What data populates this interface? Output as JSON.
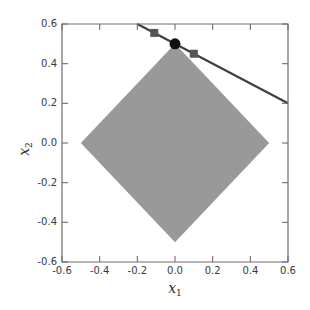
{
  "chart_data": {
    "type": "line",
    "title": "",
    "xlabel": "x_1",
    "ylabel": "x_2",
    "xlim": [
      -0.6,
      0.6
    ],
    "ylim": [
      -0.6,
      0.6
    ],
    "xticks": [
      -0.6,
      -0.4,
      -0.2,
      0.0,
      0.2,
      0.4,
      0.6
    ],
    "yticks": [
      -0.6,
      -0.4,
      -0.2,
      0.0,
      0.2,
      0.4,
      0.6
    ],
    "xtick_labels": [
      "-0.6",
      "-0.4",
      "-0.2",
      "0.0",
      "0.2",
      "0.4",
      "0.6"
    ],
    "ytick_labels": [
      "-0.6",
      "-0.4",
      "-0.2",
      "0.0",
      "0.2",
      "0.4",
      "0.6"
    ],
    "grid": false,
    "legend": null,
    "series": [
      {
        "name": "l1-ball-region",
        "type": "polygon",
        "fill": "#999999",
        "edge": "none",
        "points": [
          [
            0.0,
            0.5
          ],
          [
            0.5,
            0.0
          ],
          [
            0.0,
            -0.5
          ],
          [
            -0.5,
            0.0
          ]
        ]
      },
      {
        "name": "constraint-line",
        "type": "line",
        "color": "#3f3f3f",
        "linewidth": 2.2,
        "equation": "x2 = 0.5 - 0.5*x1",
        "x": [
          -0.2,
          0.6
        ],
        "y": [
          0.6,
          0.2
        ]
      },
      {
        "name": "square-markers",
        "type": "scatter",
        "marker": "square",
        "color": "#555555",
        "size": 8,
        "points": [
          [
            -0.11,
            0.555
          ],
          [
            0.1,
            0.45
          ]
        ]
      },
      {
        "name": "solution-marker",
        "type": "scatter",
        "marker": "circle",
        "color": "#111111",
        "size": 11,
        "points": [
          [
            0.0,
            0.5
          ]
        ]
      }
    ],
    "axes_color": "#6e6e6e",
    "background": "#ffffff"
  },
  "labels": {
    "x_axis_symbol": "x",
    "x_axis_subscript": "1",
    "y_axis_symbol": "x",
    "y_axis_subscript": "2"
  },
  "colors": {
    "region_fill": "#999999",
    "line": "#3f3f3f",
    "square_marker": "#555555",
    "circle_marker": "#111111",
    "axis": "#6e6e6e",
    "tick_text": "#3a3a3a"
  }
}
